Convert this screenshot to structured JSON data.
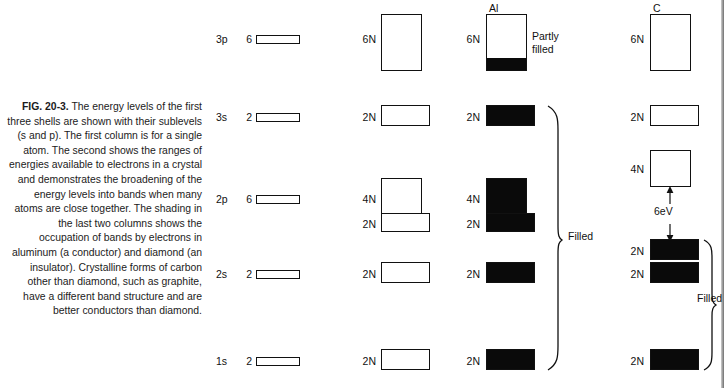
{
  "figure": {
    "label": "FIG. 20-3.",
    "caption": "The energy levels of the first three shells are shown with their sublevels (s and p). The first column is for a single atom. The second shows the ranges of energies available to electrons in a crystal and demonstrates the broadening of the energy levels into bands when many atoms are close together. The shading in the last two columns shows the occupation of bands by electrons in aluminum (a conductor) and diamond (an insulator). Crystalline forms of carbon other than diamond, such as graphite, have a different band structure and are better conductors than diamond."
  },
  "headers": {
    "aluminum": "Al",
    "carbon": "C"
  },
  "shells": [
    {
      "name": "3p",
      "atom_degeneracy": "6"
    },
    {
      "name": "3s",
      "atom_degeneracy": "2"
    },
    {
      "name": "2p",
      "atom_degeneracy": "6"
    },
    {
      "name": "2s",
      "atom_degeneracy": "2"
    },
    {
      "name": "1s",
      "atom_degeneracy": "2"
    }
  ],
  "crystal_bands": [
    {
      "shell": "3p",
      "capacity": "6N"
    },
    {
      "shell": "3s",
      "capacity": "2N"
    },
    {
      "shell": "2p_upper",
      "capacity": "4N"
    },
    {
      "shell": "2p_lower",
      "capacity": "2N"
    },
    {
      "shell": "2s",
      "capacity": "2N"
    },
    {
      "shell": "1s",
      "capacity": "2N"
    }
  ],
  "aluminum_bands": [
    {
      "shell": "3p",
      "capacity": "6N",
      "fill_percent": 22
    },
    {
      "shell": "3s",
      "capacity": "2N",
      "fill_percent": 100
    },
    {
      "shell": "2p_upper",
      "capacity": "4N",
      "fill_percent": 100
    },
    {
      "shell": "2p_lower",
      "capacity": "2N",
      "fill_percent": 100
    },
    {
      "shell": "2s",
      "capacity": "2N",
      "fill_percent": 100
    },
    {
      "shell": "1s",
      "capacity": "2N",
      "fill_percent": 100
    }
  ],
  "carbon_bands": [
    {
      "shell": "3p",
      "capacity": "6N",
      "fill_percent": 0
    },
    {
      "shell": "3s",
      "capacity": "2N",
      "fill_percent": 0
    },
    {
      "shell": "conduction",
      "capacity": "4N",
      "fill_percent": 0
    },
    {
      "shell": "valence",
      "capacity": "2N",
      "fill_percent": 100
    },
    {
      "shell": "2s",
      "capacity": "2N",
      "fill_percent": 100
    },
    {
      "shell": "1s",
      "capacity": "2N",
      "fill_percent": 100
    }
  ],
  "annotations": {
    "partly_filled_line1": "Partly",
    "partly_filled_line2": "filled",
    "aluminum_filled": "Filled",
    "carbon_filled": "Filled",
    "band_gap": "6eV"
  }
}
